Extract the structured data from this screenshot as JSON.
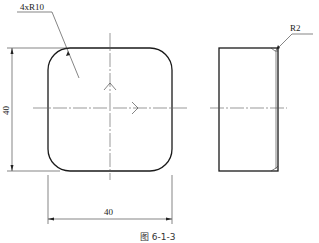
{
  "drawing": {
    "front_view": {
      "corner_radius_label": "4xR10",
      "height_dimension": "40",
      "width_dimension": "40"
    },
    "side_view": {
      "edge_radius_label": "R2"
    },
    "caption": "图 6-1-3"
  }
}
